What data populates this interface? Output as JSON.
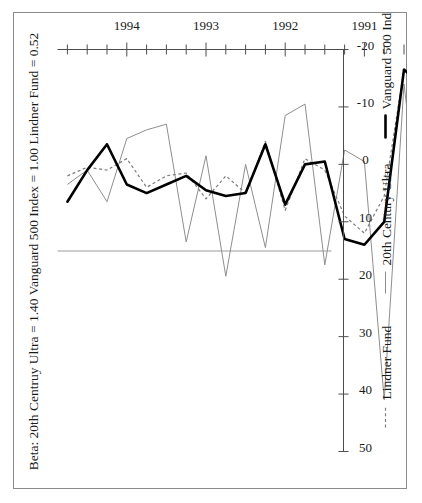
{
  "figure": {
    "frame_border_color": "#8a8a8a",
    "background": "#ffffff",
    "rotated_degrees": -90
  },
  "chart_data": {
    "type": "line",
    "title": "Beta: 20th Centruy Ultra = 1.40  Vanguard 500 Index = 1.00  Lindner Fund = 0.52",
    "subtitle": "",
    "xlabel": "",
    "ylabel": "",
    "orientation": "rotated-90-landscape-on-portrait",
    "grid": false,
    "zero_reference_line": true,
    "legend_position": "bottom",
    "xlim": [
      1989.875,
      1994.875
    ],
    "ylim": [
      -20,
      50
    ],
    "x_tick_labels": [
      "1990",
      "1991",
      "1992",
      "1993",
      "1994"
    ],
    "x_tick_values": [
      1990,
      1991,
      1992,
      1993,
      1994
    ],
    "x_minor_tick_count_per_year": 4,
    "y_tick_labels": [
      "50",
      "40",
      "30",
      "20",
      "10",
      "0",
      "-10",
      "-20"
    ],
    "y_tick_values": [
      50,
      40,
      30,
      20,
      10,
      0,
      -10,
      -20
    ],
    "x": [
      1990.0,
      1990.25,
      1990.5,
      1990.75,
      1991.0,
      1991.25,
      1991.5,
      1991.75,
      1992.0,
      1992.25,
      1992.5,
      1992.75,
      1993.0,
      1993.25,
      1993.5,
      1993.75,
      1994.0,
      1994.25,
      1994.5,
      1994.75
    ],
    "series": [
      {
        "name": "Lindner Fund",
        "style": "dotted",
        "color": "#7c7c7c",
        "values": [
          -3.0,
          -9.5,
          -16.5,
          5.5,
          12.0,
          9.0,
          1.0,
          -1.0,
          8.0,
          -4.0,
          5.0,
          2.0,
          6.0,
          1.5,
          2.0,
          4.0,
          -1.0,
          1.0,
          0.5,
          2.0
        ]
      },
      {
        "name": "20th Century Ultra",
        "style": "thin-solid",
        "color": "#8e8e8e",
        "values": [
          -8.0,
          15.5,
          -14.0,
          41.0,
          -0.5,
          -2.5,
          17.5,
          -10.5,
          -8.5,
          14.5,
          0.0,
          19.5,
          -1.5,
          13.5,
          -7.0,
          -6.0,
          -4.5,
          6.5,
          1.0,
          3.5
        ]
      },
      {
        "name": "Vanguard 500 Index",
        "style": "thick-solid",
        "color": "#000000",
        "values": [
          -5.5,
          -13.5,
          -16.5,
          10.0,
          14.0,
          13.0,
          -0.5,
          0.0,
          7.0,
          -3.5,
          5.0,
          5.5,
          4.5,
          2.0,
          3.5,
          5.0,
          3.5,
          -3.5,
          1.0,
          6.5
        ]
      }
    ]
  },
  "legend": {
    "items": [
      {
        "label": "Lindner Fund",
        "marker": "dotted-line-marker"
      },
      {
        "label": "20th Century Ultra",
        "marker": "thin-line-marker"
      },
      {
        "label": "Vanguard 500 Index",
        "marker": "thick-line-marker"
      }
    ]
  }
}
